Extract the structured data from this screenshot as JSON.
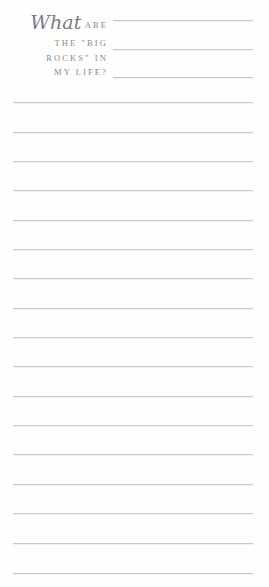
{
  "page": {
    "background_color": "#fffefe",
    "width": 269,
    "height": 587
  },
  "prompt": {
    "full_text": "What ARE THE \"BIG ROCKS\" IN MY LIFE?",
    "script_word": "What",
    "line1_caps": "ARE",
    "line2": "THE \"BIG",
    "line3": "ROCKS\" IN",
    "line4": "MY LIFE?",
    "text_color": "#7e838f"
  },
  "rules": {
    "line_color": "#c7c9cd",
    "header_rules": [
      {
        "id": "header-rule-1",
        "top": 20
      },
      {
        "id": "header-rule-2",
        "top": 49
      },
      {
        "id": "header-rule-3",
        "top": 77
      }
    ],
    "body_rules": [
      {
        "id": "body-rule-1",
        "top": 102
      },
      {
        "id": "body-rule-2",
        "top": 132
      },
      {
        "id": "body-rule-3",
        "top": 161
      },
      {
        "id": "body-rule-4",
        "top": 190
      },
      {
        "id": "body-rule-5",
        "top": 220
      },
      {
        "id": "body-rule-6",
        "top": 249
      },
      {
        "id": "body-rule-7",
        "top": 278
      },
      {
        "id": "body-rule-8",
        "top": 308
      },
      {
        "id": "body-rule-9",
        "top": 337
      },
      {
        "id": "body-rule-10",
        "top": 366
      },
      {
        "id": "body-rule-11",
        "top": 396
      },
      {
        "id": "body-rule-12",
        "top": 425
      },
      {
        "id": "body-rule-13",
        "top": 454
      },
      {
        "id": "body-rule-14",
        "top": 484
      },
      {
        "id": "body-rule-15",
        "top": 513
      },
      {
        "id": "body-rule-16",
        "top": 543
      },
      {
        "id": "body-rule-17",
        "top": 573
      }
    ]
  }
}
